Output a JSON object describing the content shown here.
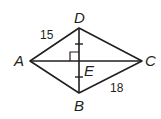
{
  "figure": {
    "type": "rhombus-with-diagonals",
    "line_color": "#231f20",
    "background": "#ffffff",
    "vertices": {
      "A": {
        "label": "A",
        "x": 30,
        "y": 61
      },
      "B": {
        "label": "B",
        "x": 79,
        "y": 93
      },
      "C": {
        "label": "C",
        "x": 142,
        "y": 61
      },
      "D": {
        "label": "D",
        "x": 79,
        "y": 28
      },
      "E": {
        "label": "E",
        "x": 79,
        "y": 61
      }
    },
    "side_lengths": {
      "AD": "15",
      "BC": "18"
    },
    "markings": {
      "right_angle_at": "E",
      "congruent_segments": [
        "DE",
        "EB"
      ]
    }
  }
}
